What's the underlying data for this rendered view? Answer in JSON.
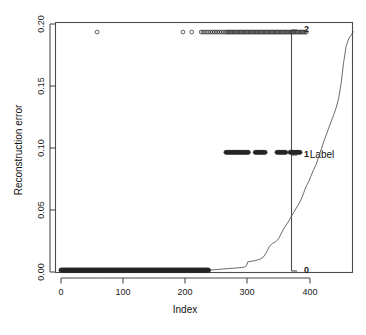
{
  "chart_data": {
    "type": "scatter",
    "title": "",
    "xlabel": "Index",
    "ylabel": "Reconstruction error",
    "xlim": [
      -15,
      475
    ],
    "ylim": [
      0.0,
      0.205
    ],
    "grid": false,
    "x_ticks": [
      0,
      100,
      200,
      300,
      400
    ],
    "x_ticklabels": [
      "0",
      "100",
      "200",
      "300",
      "400"
    ],
    "y_ticks": [
      0.0,
      0.05,
      0.1,
      0.15,
      0.2
    ],
    "y_ticklabels": [
      "0.00",
      "0.05",
      "0.10",
      "0.15",
      "0.20"
    ],
    "secondary_axis": {
      "label": "Label",
      "ticks": [
        0,
        1,
        2
      ],
      "ticklabels": [
        "0",
        "1",
        "2"
      ],
      "position": "right-inset"
    },
    "series": [
      {
        "name": "Label 2 points",
        "marker": "open-circle",
        "y_value": 0.1935,
        "x_values": [
          58,
          196,
          210,
          225,
          228,
          231,
          234,
          237,
          240,
          243,
          246,
          249,
          252,
          255,
          258,
          261,
          264,
          266,
          268,
          270,
          272,
          274,
          276,
          278,
          280,
          282,
          284,
          286,
          288,
          290,
          292,
          294,
          296,
          298,
          300,
          302,
          304,
          306,
          308,
          310,
          312,
          314,
          316,
          318,
          320,
          322,
          324,
          326,
          328,
          330,
          332,
          334,
          336,
          338,
          340,
          342,
          344,
          346,
          348,
          350,
          352,
          354,
          356,
          358,
          360,
          362,
          364,
          366,
          368,
          370,
          372,
          374,
          376,
          378,
          380,
          382,
          384,
          386,
          388,
          390,
          392,
          394
        ]
      },
      {
        "name": "Label 1 points",
        "marker": "filled-circle",
        "y_value": 0.0965,
        "x_values": [
          265,
          267,
          269,
          271,
          273,
          275,
          277,
          279,
          281,
          283,
          285,
          287,
          289,
          291,
          293,
          295,
          297,
          299,
          301,
          312,
          314,
          316,
          318,
          320,
          322,
          324,
          326,
          328,
          347,
          349,
          351,
          353,
          355,
          357,
          359,
          361,
          368,
          370,
          372,
          374,
          376,
          378,
          380,
          382,
          384
        ]
      },
      {
        "name": "Label 0 points",
        "marker": "filled-circle",
        "y_value": 0.0015,
        "x_range": [
          0,
          237
        ],
        "count": 238
      }
    ],
    "step_curve": {
      "name": "Sorted reconstruction error",
      "description": "Monotonically increasing sorted error curve",
      "x": [
        0,
        230,
        240,
        250,
        260,
        270,
        280,
        290,
        295,
        298,
        300,
        305,
        310,
        315,
        320,
        325,
        330,
        335,
        340,
        345,
        350,
        355,
        358,
        362,
        366,
        370,
        374,
        378,
        382,
        386,
        390,
        394,
        398,
        402,
        406,
        410,
        414,
        418,
        422,
        426,
        430,
        434,
        438,
        442,
        446,
        450,
        454,
        458,
        462,
        466,
        470
      ],
      "y": [
        0.0008,
        0.001,
        0.0016,
        0.002,
        0.0024,
        0.0028,
        0.0032,
        0.0036,
        0.004,
        0.005,
        0.0082,
        0.0086,
        0.009,
        0.0096,
        0.0104,
        0.012,
        0.0158,
        0.0208,
        0.0232,
        0.0244,
        0.0272,
        0.0324,
        0.0352,
        0.038,
        0.0412,
        0.0448,
        0.0482,
        0.0516,
        0.0548,
        0.0588,
        0.064,
        0.0692,
        0.073,
        0.078,
        0.0828,
        0.0868,
        0.093,
        0.099,
        0.105,
        0.1104,
        0.116,
        0.1214,
        0.1268,
        0.1324,
        0.14,
        0.152,
        0.169,
        0.182,
        0.188,
        0.191,
        0.194
      ]
    }
  }
}
